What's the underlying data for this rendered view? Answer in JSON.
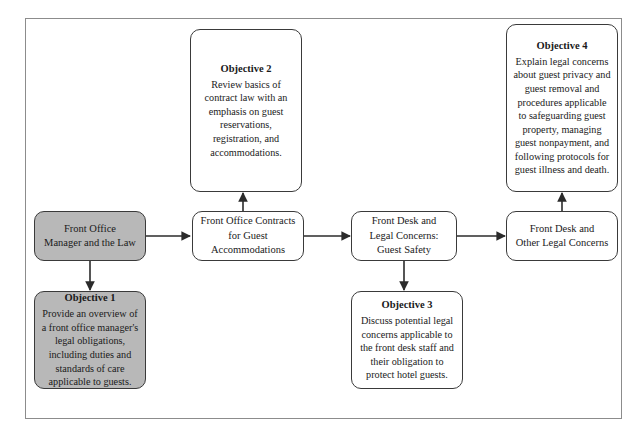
{
  "diagram": {
    "type": "flowchart",
    "frame_label": "page-frame",
    "shaded_color": "#b8b8b8",
    "line_color": "#3a3a3a",
    "nodes": [
      {
        "id": "front-office-manager",
        "title": "",
        "text": "Front Office\nManager and the Law",
        "line1": "Front Office",
        "line2": "Manager and the Law",
        "shaded": true
      },
      {
        "id": "objective-1",
        "title": "Objective 1",
        "text": "Provide an overview of a front office manager's legal obligations, including duties and standards of care applicable to guests.",
        "shaded": true
      },
      {
        "id": "objective-2",
        "title": "Objective 2",
        "text": "Review basics of contract law with an emphasis on guest reservations, registration, and accommodations.",
        "shaded": false
      },
      {
        "id": "front-office-contracts",
        "title": "",
        "text": "Front Office Contracts for Guest Accommodations",
        "line1": "Front Office Contracts",
        "line2": "for Guest",
        "line3": "Accommodations",
        "shaded": false
      },
      {
        "id": "front-desk-guest-safety",
        "title": "",
        "text": "Front Desk and Legal Concerns: Guest Safety",
        "line1": "Front Desk and",
        "line2": "Legal Concerns:",
        "line3": "Guest Safety",
        "shaded": false
      },
      {
        "id": "objective-3",
        "title": "Objective 3",
        "text": "Discuss potential legal concerns applicable to the front desk staff and their obligation to protect hotel guests.",
        "shaded": false
      },
      {
        "id": "objective-4",
        "title": "Objective 4",
        "text": "Explain legal concerns about guest privacy and guest removal and procedures applicable to safeguarding guest property, managing guest nonpayment, and following protocols for guest illness and death.",
        "shaded": false
      },
      {
        "id": "front-desk-other",
        "title": "",
        "text": "Front Desk and Other Legal Concerns",
        "line1": "Front Desk and",
        "line2": "Other Legal Concerns",
        "shaded": false
      }
    ],
    "connectors": [
      {
        "from": "front-office-manager",
        "to": "front-office-contracts",
        "direction": "right"
      },
      {
        "from": "front-office-manager",
        "to": "objective-1",
        "direction": "down"
      },
      {
        "from": "front-office-contracts",
        "to": "objective-2",
        "direction": "up"
      },
      {
        "from": "front-office-contracts",
        "to": "front-desk-guest-safety",
        "direction": "right"
      },
      {
        "from": "front-desk-guest-safety",
        "to": "objective-3",
        "direction": "down"
      },
      {
        "from": "front-desk-guest-safety",
        "to": "front-desk-other",
        "direction": "right"
      },
      {
        "from": "front-desk-other",
        "to": "objective-4",
        "direction": "up"
      }
    ]
  }
}
